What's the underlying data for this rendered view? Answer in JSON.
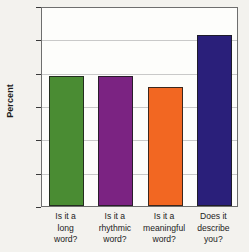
{
  "chart_data": {
    "type": "bar",
    "title": "",
    "xlabel": "",
    "ylabel": "Percent",
    "ylim": [
      0,
      30
    ],
    "yticks": [
      0,
      5,
      10,
      15,
      20,
      25,
      30
    ],
    "ytick_labels": [
      "0",
      "5",
      "10",
      "15",
      "20",
      "25",
      "30"
    ],
    "grid": true,
    "legend": false,
    "categories": [
      "Is it a long word?",
      "Is it a rhythmic word?",
      "Is it a meaningful word?",
      "Does it describe you?"
    ],
    "category_lines": [
      [
        "Is it a",
        "long",
        "word?"
      ],
      [
        "Is it a",
        "rhythmic",
        "word?"
      ],
      [
        "Is it a",
        "meaningful",
        "word?"
      ],
      [
        "Does it",
        "describe",
        "you?"
      ]
    ],
    "values": [
      19.5,
      19.5,
      17.8,
      25.6
    ],
    "colors": [
      "#4a8c33",
      "#7b2382",
      "#f26722",
      "#2a1f7a"
    ]
  },
  "figure": {
    "background": "#f3f2ee",
    "plot_background": "#fdfdfb",
    "axis_color": "#6e6e6e",
    "grid_color": "#c9c9c9",
    "text_color": "#1c1c1c"
  }
}
